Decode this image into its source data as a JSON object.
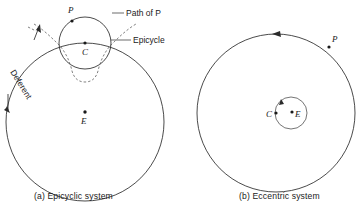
{
  "figure": {
    "background_color": "#ffffff",
    "ink_color": "#2b2b2b"
  },
  "panel_a": {
    "caption": "(a) Epicyclic system",
    "labels": {
      "p": "P",
      "c": "C",
      "e": "E",
      "path_of_p": "Path of P",
      "epicycle": "Epicycle",
      "deferent": "Deferent"
    },
    "geometry": {
      "deferent_center_x": 85,
      "deferent_center_y": 122,
      "deferent_radius": 79,
      "epicycle_center_x": 85,
      "epicycle_center_y": 43,
      "epicycle_radius": 26,
      "point_p_x": 72,
      "point_p_y": 20,
      "earth_x": 85,
      "earth_y": 118
    }
  },
  "panel_b": {
    "caption": "(b) Eccentric system",
    "labels": {
      "p": "P",
      "c": "C",
      "e": "E"
    },
    "geometry": {
      "outer_center_x": 276,
      "outer_center_y": 113,
      "outer_radius": 79,
      "inner_center_x": 291,
      "inner_center_y": 113,
      "inner_radius": 16,
      "point_p_x": 327,
      "point_p_y": 44,
      "point_c_x": 275,
      "point_c_y": 113,
      "point_e_x": 294,
      "point_e_y": 113
    }
  }
}
